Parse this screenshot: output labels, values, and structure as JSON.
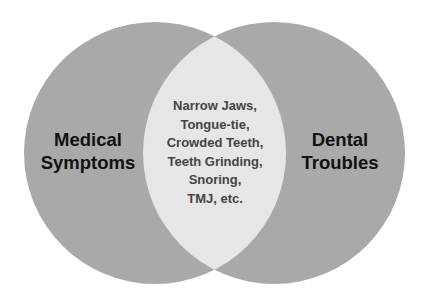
{
  "diagram": {
    "type": "venn",
    "colors": {
      "background": "#ffffff",
      "circle_fill": "#a9a9a9",
      "intersection_fill": "#e6e6e6",
      "label_text": "#111111",
      "center_text": "#444444"
    },
    "left_circle": {
      "label_lines": [
        "Medical",
        "Symptoms"
      ]
    },
    "right_circle": {
      "label_lines": [
        "Dental",
        "Troubles"
      ]
    },
    "intersection": {
      "lines": [
        "Narrow Jaws,",
        "Tongue-tie,",
        "Crowded Teeth,",
        "Teeth Grinding,",
        "Snoring,",
        "TMJ, etc."
      ]
    }
  }
}
